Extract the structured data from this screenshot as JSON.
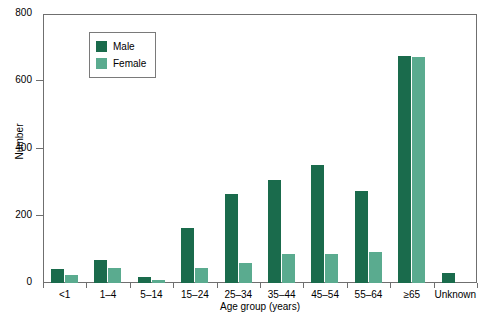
{
  "chart_data": {
    "type": "bar",
    "title": "",
    "xlabel": "Age group (years)",
    "ylabel": "Number",
    "ylim": [
      0,
      800
    ],
    "yticks": [
      0,
      200,
      400,
      600,
      800
    ],
    "grid": false,
    "legend_position": "top-left-inside",
    "categories": [
      "<1",
      "1–4",
      "5–14",
      "15–24",
      "25–34",
      "35–44",
      "45–54",
      "55–64",
      "≥65",
      "Unknown"
    ],
    "series": [
      {
        "name": "Male",
        "color": "#1a6b4c",
        "values": [
          42,
          68,
          18,
          165,
          265,
          307,
          351,
          275,
          675,
          30
        ]
      },
      {
        "name": "Female",
        "color": "#5aab8f",
        "values": [
          25,
          45,
          10,
          45,
          60,
          85,
          87,
          93,
          672,
          0
        ]
      }
    ]
  },
  "axes": {
    "y_title": "Number",
    "x_title": "Age group (years)",
    "y_tick_labels": [
      "0",
      "200",
      "400",
      "600",
      "800"
    ]
  },
  "legend": {
    "items": [
      {
        "label": "Male"
      },
      {
        "label": "Female"
      }
    ]
  }
}
